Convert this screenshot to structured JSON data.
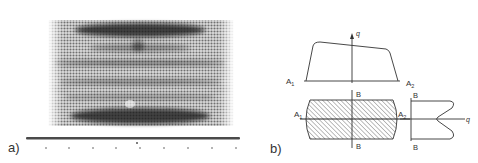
{
  "figure": {
    "panels": [
      {
        "id": "a",
        "label": "a)",
        "kind": "halftone-photograph",
        "description": "striped band pattern with horizontal dark bands",
        "scale_ticks": 9
      },
      {
        "id": "b",
        "label": "b)",
        "kind": "schematic",
        "top_profile": {
          "axis_label": "q",
          "left_label": "A",
          "left_sub": "1",
          "right_label": "A",
          "right_sub": "2"
        },
        "cross_section": {
          "left_label": "A",
          "left_sub": "1",
          "right_label": "A",
          "right_sub": "2",
          "top_label": "B",
          "bottom_label": "B"
        },
        "side_profile": {
          "axis_label": "q",
          "top_label": "B",
          "bottom_label": "B"
        }
      }
    ]
  },
  "colors": {
    "ink": "#333333",
    "halftone_dark": "#1e1e1e",
    "background": "#ffffff"
  }
}
